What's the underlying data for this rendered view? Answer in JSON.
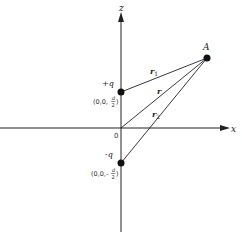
{
  "diagram": {
    "axes": {
      "z_label": "z",
      "x_label": "x",
      "origin_label": "0"
    },
    "point_A": {
      "label": "A"
    },
    "charge_positive": {
      "label": "+q",
      "coord_prefix": "(0,0,",
      "coord_num": "d",
      "coord_den": "2",
      "coord_suffix": ")"
    },
    "charge_negative": {
      "label": "-q",
      "coord_prefix": "(0,0,-",
      "coord_num": "d",
      "coord_den": "2",
      "coord_suffix": ")"
    },
    "vectors": {
      "r1": {
        "symbol": "r",
        "subscript": "1"
      },
      "r": {
        "symbol": "r"
      },
      "r2": {
        "symbol": "r",
        "subscript": "2"
      }
    },
    "colors": {
      "line": "#222222",
      "dot": "#111111",
      "background": "#ffffff"
    }
  }
}
